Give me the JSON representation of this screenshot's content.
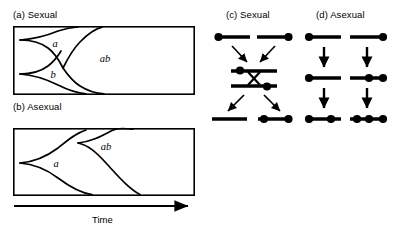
{
  "figure": {
    "background_color": "#ffffff",
    "line_color": "#000000"
  },
  "panels": {
    "a": {
      "caption": "(a) Sexual",
      "box": {
        "x": 13,
        "y": 26,
        "width": 182,
        "height": 69
      },
      "genotype_labels": [
        {
          "text": "a",
          "x": 55,
          "y": 47
        },
        {
          "text": "b",
          "x": 53,
          "y": 76
        },
        {
          "text": "ab",
          "x": 103,
          "y": 60
        }
      ]
    },
    "b": {
      "caption": "(b) Asexual",
      "box": {
        "x": 13,
        "y": 118,
        "width": 182,
        "height": 73
      },
      "genotype_labels": [
        {
          "text": "a",
          "x": 55,
          "y": 163
        },
        {
          "text": "ab",
          "x": 104,
          "y": 147
        }
      ]
    },
    "c": {
      "caption": "(c) Sexual",
      "rows": [
        {
          "row": 1,
          "segments": [
            {
              "x1": 217,
              "x2": 249,
              "y": 37,
              "dots": [
                217
              ]
            },
            {
              "x1": 257,
              "x2": 289,
              "y": 37,
              "dots": [
                289
              ]
            }
          ]
        },
        {
          "row": 2,
          "segments": [
            {
              "x1": 231,
              "x2": 275,
              "y": 70,
              "dots": [
                239
              ]
            },
            {
              "x1": 231,
              "x2": 275,
              "y": 84,
              "dots": [
                267
              ]
            }
          ],
          "crossover": true
        },
        {
          "row": 3,
          "segments": [
            {
              "x1": 213,
              "x2": 247,
              "y": 118,
              "dots": []
            },
            {
              "x1": 258,
              "x2": 291,
              "y": 118,
              "dots": [
                264,
                288
              ]
            }
          ]
        }
      ],
      "arrows": [
        {
          "x1": 232,
          "y1": 44,
          "x2": 248,
          "y2": 62
        },
        {
          "x1": 274,
          "y1": 44,
          "x2": 258,
          "y2": 62
        },
        {
          "x1": 243,
          "y1": 92,
          "x2": 227,
          "y2": 110
        },
        {
          "x1": 263,
          "y1": 92,
          "x2": 279,
          "y2": 110
        }
      ]
    },
    "d": {
      "caption": "(d) Asexual",
      "rows": [
        {
          "row": 1,
          "segments": [
            {
              "x1": 307,
              "x2": 341,
              "y": 37,
              "dots": [
                310
              ]
            },
            {
              "x1": 350,
              "x2": 385,
              "y": 37,
              "dots": [
                382
              ]
            }
          ]
        },
        {
          "row": 2,
          "segments": [
            {
              "x1": 307,
              "x2": 341,
              "y": 77,
              "dots": [
                310
              ]
            },
            {
              "x1": 350,
              "x2": 385,
              "y": 77,
              "dots": [
                369,
                382
              ]
            }
          ]
        },
        {
          "row": 3,
          "segments": [
            {
              "x1": 307,
              "x2": 341,
              "y": 118,
              "dots": [
                310,
                331
              ]
            },
            {
              "x1": 350,
              "x2": 385,
              "y": 118,
              "dots": [
                358,
                369,
                382
              ]
            }
          ]
        }
      ],
      "arrows": [
        {
          "x1": 324,
          "y1": 45,
          "x2": 324,
          "y2": 68
        },
        {
          "x1": 367,
          "y1": 45,
          "x2": 367,
          "y2": 68
        },
        {
          "x1": 324,
          "y1": 86,
          "x2": 324,
          "y2": 109
        },
        {
          "x1": 367,
          "y1": 86,
          "x2": 367,
          "y2": 109
        }
      ]
    }
  },
  "axis": {
    "label": "Time",
    "arrow": {
      "x1": 14,
      "x2": 194,
      "y": 206
    }
  }
}
